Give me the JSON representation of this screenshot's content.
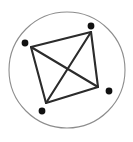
{
  "figure": {
    "canvas": {
      "width": 133,
      "height": 142,
      "background": "#ffffff"
    },
    "circle": {
      "name": "enclosing-circle",
      "cx": 67,
      "cy": 70,
      "r": 58,
      "stroke": "#8d8d8d",
      "stroke_width": 1.1,
      "fill": "none"
    },
    "polygon": {
      "name": "quadrilateral",
      "stroke": "#2b2b2b",
      "stroke_width": 2.1,
      "fill": "none",
      "vertices": [
        {
          "label": "left-vertex",
          "x": 31,
          "y": 47
        },
        {
          "label": "top-vertex",
          "x": 91,
          "y": 32
        },
        {
          "label": "right-vertex",
          "x": 98,
          "y": 87
        },
        {
          "label": "bottom-vertex",
          "x": 46,
          "y": 103
        }
      ],
      "edges": [
        {
          "label": "edge-left-top",
          "x1": 31,
          "y1": 47,
          "x2": 91,
          "y2": 32
        },
        {
          "label": "edge-top-right",
          "x1": 91,
          "y1": 32,
          "x2": 98,
          "y2": 87
        },
        {
          "label": "edge-right-bottom",
          "x1": 98,
          "y1": 87,
          "x2": 46,
          "y2": 103
        },
        {
          "label": "edge-bottom-left",
          "x1": 46,
          "y1": 103,
          "x2": 31,
          "y2": 47
        }
      ],
      "diagonals": [
        {
          "label": "diagonal-left-right",
          "x1": 31,
          "y1": 47,
          "x2": 98,
          "y2": 87
        },
        {
          "label": "diagonal-top-bottom",
          "x1": 91,
          "y1": 32,
          "x2": 46,
          "y2": 103
        }
      ],
      "diagonal_intersection": {
        "x": 69,
        "y": 68
      }
    },
    "points": [
      {
        "label": "point-left",
        "x": 25,
        "y": 43,
        "r": 3.4,
        "fill": "#111111"
      },
      {
        "label": "point-top",
        "x": 91,
        "y": 26,
        "r": 3.4,
        "fill": "#111111"
      },
      {
        "label": "point-right",
        "x": 109,
        "y": 91,
        "r": 3.4,
        "fill": "#111111"
      },
      {
        "label": "point-bottom",
        "x": 42,
        "y": 111,
        "r": 3.4,
        "fill": "#111111"
      }
    ]
  }
}
